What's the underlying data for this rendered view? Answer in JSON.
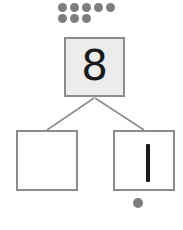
{
  "worksheet": {
    "type": "number-bond",
    "title": "Number bond for 8",
    "total": {
      "value": "8",
      "filled": true,
      "box_fill_color": "#ececec",
      "box_border_color": "#8c8c8c"
    },
    "parts": [
      {
        "position": "left",
        "value": "",
        "filled": false,
        "box_fill_color": "#ffffff",
        "box_border_color": "#8c8c8c"
      },
      {
        "position": "right",
        "value": "1",
        "filled": true,
        "box_fill_color": "#ffffff",
        "box_border_color": "#8c8c8c"
      }
    ],
    "connectors": {
      "color": "#8c8c8c",
      "count": 2
    }
  },
  "counters": {
    "color": "#7d7d7d",
    "top_group": {
      "label": "eight counters",
      "total": 8,
      "rows": [
        5,
        3
      ]
    },
    "bottom_group": {
      "label": "one counter",
      "total": 1,
      "rows": [
        1
      ]
    }
  }
}
